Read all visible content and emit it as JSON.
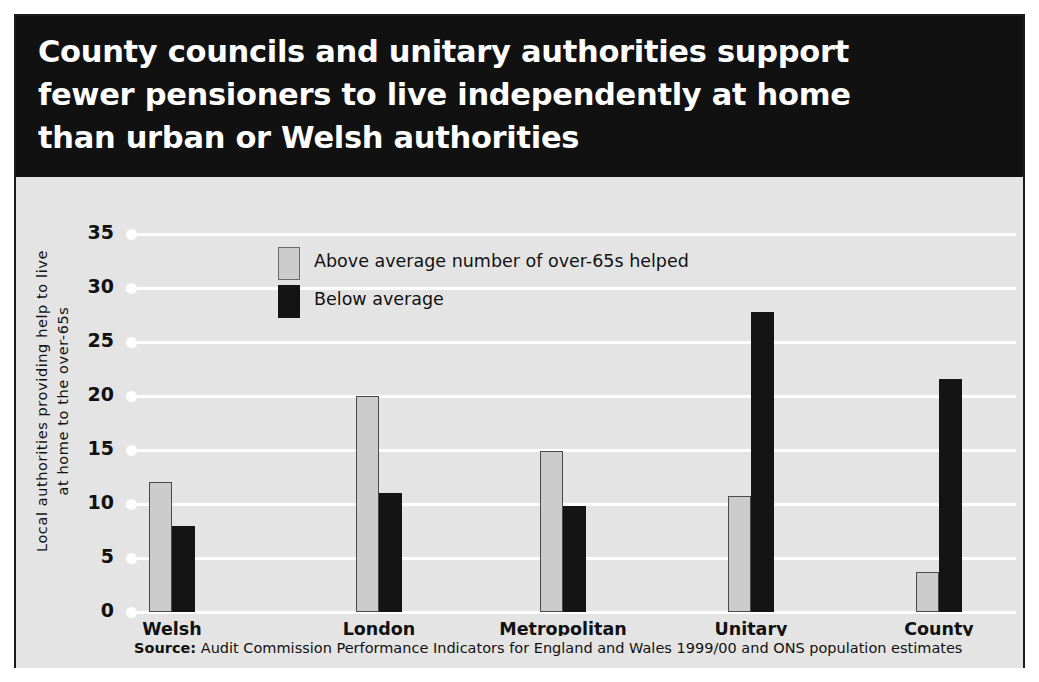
{
  "header": {
    "title": "County councils and unitary authorities support\nfewer pensioners to live independently at home\nthan urban or Welsh authorities"
  },
  "footer": {
    "source_label": "Source:",
    "source_text": " Audit Commission Performance Indicators for England and Wales 1999/00 and ONS population estimates"
  },
  "colors": {
    "header_background": "#111111",
    "panel_background": "#e4e4e4",
    "gridline": "#ffffff",
    "above_average_bar": "#cccccc",
    "below_average_bar": "#141414",
    "text": "#111111"
  },
  "chart_data": {
    "type": "bar",
    "title": "County councils and unitary authorities support fewer pensioners to live independently at home than urban or Welsh authorities",
    "xlabel": "",
    "ylabel": "Local authorities providing help to live\nat home to the over-65s",
    "ylim": [
      0,
      35
    ],
    "yticks": [
      0,
      5,
      10,
      15,
      20,
      25,
      30,
      35
    ],
    "ytick_labels": [
      "0",
      "5",
      "10",
      "15",
      "20",
      "25",
      "30",
      "35"
    ],
    "grid": true,
    "legend_position": "upper-left-inside",
    "categories": [
      "Welsh\nauthorities",
      "London\nboroughs",
      "Metropolitan\nauthorities",
      "Unitary\nauthorities",
      "County\ncouncils"
    ],
    "series": [
      {
        "name": "Above average number of over-65s helped",
        "color": "#cccccc",
        "values": [
          12,
          20,
          14.9,
          10.7,
          3.7
        ]
      },
      {
        "name": "Below average",
        "color": "#141414",
        "values": [
          8,
          11,
          9.8,
          27.8,
          21.6
        ]
      }
    ],
    "source": "Source: Audit Commission Performance Indicators for England and Wales 1999/00 and ONS population estimates"
  }
}
